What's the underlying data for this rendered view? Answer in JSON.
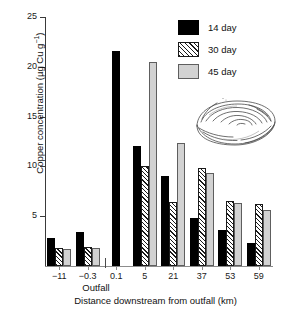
{
  "chart_data": {
    "type": "bar",
    "title": "",
    "xlabel": "Distance downstream from outfall (km)",
    "ylabel": "Copper concentration (µg Cu g⁻¹)",
    "ylim": [
      0,
      25
    ],
    "yticks": [
      0,
      5,
      10,
      15,
      20,
      25
    ],
    "ytick_labels": [
      "",
      "5",
      "10",
      "15",
      "20",
      "25"
    ],
    "grid": false,
    "legend_position": "top-right",
    "categories": [
      "−11",
      "−0.3",
      "0.1",
      "5",
      "21",
      "37",
      "53",
      "59"
    ],
    "annotations": [
      {
        "text": "Outfall",
        "between": [
          "−0.3",
          "0.1"
        ]
      }
    ],
    "series": [
      {
        "name": "14 day",
        "fill": "solid-black",
        "color": "#000000",
        "values": [
          2.8,
          3.4,
          21.6,
          12.0,
          9.0,
          4.8,
          3.6,
          2.3
        ]
      },
      {
        "name": "30 day",
        "fill": "diagonal-hatch",
        "color": "#1a1a1a",
        "values": [
          1.8,
          1.9,
          null,
          10.0,
          6.4,
          9.8,
          6.5,
          6.2
        ]
      },
      {
        "name": "45 day",
        "fill": "light-gray",
        "color": "#d2d2d2",
        "values": [
          1.7,
          1.8,
          null,
          20.5,
          12.4,
          9.3,
          6.3,
          5.6
        ]
      }
    ]
  },
  "legend": {
    "items": [
      {
        "label": "14 day"
      },
      {
        "label": "30 day"
      },
      {
        "label": "45 day"
      }
    ]
  },
  "inset": {
    "name": "clam-shell-drawing"
  },
  "yticks": {
    "t25": "25",
    "t20": "20",
    "t15": "15",
    "t10": "10",
    "t5": "5"
  },
  "xticks": {
    "c0": "−11",
    "c1": "−0.3",
    "c2": "0.1",
    "c3": "5",
    "c4": "21",
    "c5": "37",
    "c6": "53",
    "c7": "59"
  },
  "labels": {
    "ylabel_main": "Copper concentration (µg Cu g",
    "ylabel_sup": "−1",
    "ylabel_tail": ")",
    "xlabel": "Distance downstream from outfall (km)",
    "outfall": "Outfall"
  }
}
